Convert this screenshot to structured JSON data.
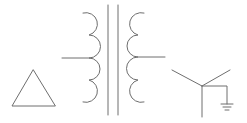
{
  "diagram": {
    "title": "",
    "colors": {
      "line": "#6e6e6e",
      "background": "#ffffff"
    },
    "components": [
      {
        "name": "delta-winding-symbol",
        "shape": "triangle"
      },
      {
        "name": "primary-coil",
        "turns": 4,
        "center_tap": true
      },
      {
        "name": "iron-core",
        "lines": 2
      },
      {
        "name": "secondary-coil",
        "turns": 4,
        "center_tap": true
      },
      {
        "name": "wye-winding-symbol",
        "shape": "wye",
        "grounded": true
      },
      {
        "name": "ground-symbol",
        "bars": 3
      }
    ]
  }
}
